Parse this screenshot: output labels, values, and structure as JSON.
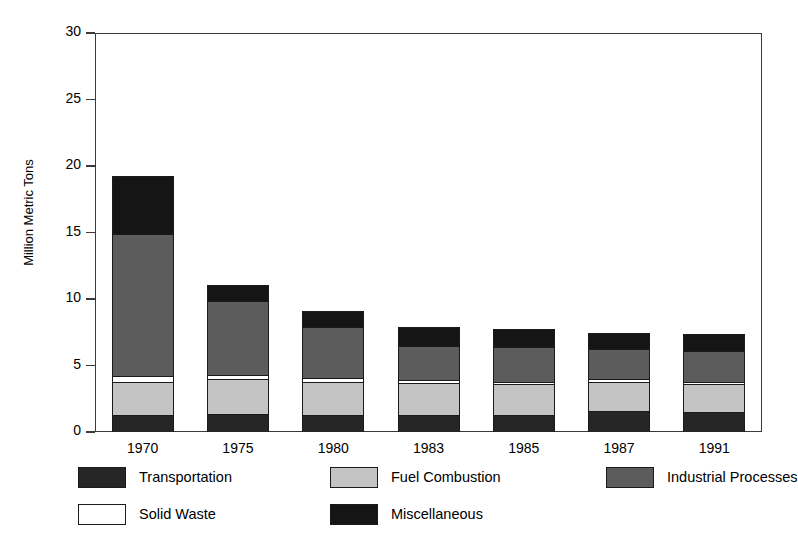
{
  "chart_data": {
    "type": "bar",
    "subtype": "stacked-vertical",
    "title": "",
    "xlabel": "",
    "ylabel": "Million Metric Tons",
    "ylim": [
      0,
      30
    ],
    "yticks": [
      0,
      5,
      10,
      15,
      20,
      25,
      30
    ],
    "ytick_labels": [
      "0",
      "5",
      "10",
      "15",
      "20",
      "25",
      "30"
    ],
    "grid": false,
    "legend_position": "bottom",
    "categories": [
      "1970",
      "1975",
      "1980",
      "1983",
      "1985",
      "1987",
      "1991"
    ],
    "stack_order_bottom_to_top": [
      "Transportation",
      "Fuel Combustion",
      "Solid Waste",
      "Industrial Processes",
      "Miscellaneous"
    ],
    "series": [
      {
        "name": "Transportation",
        "color": "#262626",
        "values": [
          1.2,
          1.3,
          1.2,
          1.2,
          1.2,
          1.5,
          1.4
        ]
      },
      {
        "name": "Fuel Combustion",
        "color": "#c4c4c4",
        "values": [
          2.5,
          2.6,
          2.5,
          2.4,
          2.3,
          2.2,
          2.1
        ]
      },
      {
        "name": "Solid Waste",
        "color": "#ffffff",
        "values": [
          0.4,
          0.3,
          0.3,
          0.2,
          0.2,
          0.2,
          0.2
        ]
      },
      {
        "name": "Industrial Processes",
        "color": "#5c5c5c",
        "values": [
          10.7,
          5.6,
          3.8,
          2.6,
          2.6,
          2.3,
          2.3
        ]
      },
      {
        "name": "Miscellaneous",
        "color": "#151515",
        "values": [
          4.4,
          1.2,
          1.2,
          1.4,
          1.4,
          1.2,
          1.3
        ]
      }
    ],
    "totals": [
      19.2,
      11.0,
      9.0,
      7.8,
      7.7,
      7.4,
      7.3
    ]
  },
  "legend": {
    "entries": [
      {
        "label": "Transportation",
        "swatch": "#262626",
        "row": 0,
        "col": 0
      },
      {
        "label": "Fuel Combustion",
        "swatch": "#c4c4c4",
        "row": 0,
        "col": 1
      },
      {
        "label": "Industrial Processes",
        "swatch": "#5c5c5c",
        "row": 0,
        "col": 2
      },
      {
        "label": "Solid Waste",
        "swatch": "#ffffff",
        "row": 1,
        "col": 0
      },
      {
        "label": "Miscellaneous",
        "swatch": "#151515",
        "row": 1,
        "col": 1
      }
    ]
  },
  "axis": {
    "y_title": "Million Metric Tons"
  }
}
